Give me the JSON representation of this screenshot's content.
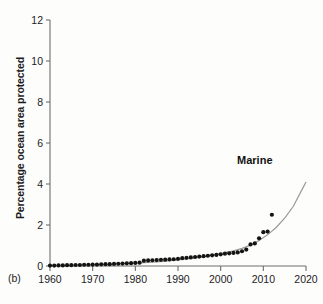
{
  "figure": {
    "panel_tag": "(b)",
    "background_color": "#fdfdfc",
    "axis_color": "#6e6e6e",
    "marker_color": "#141414",
    "curve_color": "#9a9a9a"
  },
  "chart_data": {
    "type": "scatter",
    "title": "",
    "xlabel": "",
    "ylabel": "Percentage ocean area protected",
    "xlim": [
      1960,
      2020
    ],
    "ylim": [
      0,
      12
    ],
    "xticks": [
      1960,
      1970,
      1980,
      1990,
      2000,
      2010,
      2020
    ],
    "xtick_labels": [
      "1960",
      "1970",
      "1980",
      "1990",
      "2000",
      "2010",
      "2020"
    ],
    "yticks": [
      0,
      2,
      4,
      6,
      8,
      10,
      12
    ],
    "ytick_labels": [
      "0",
      "2",
      "4",
      "6",
      "8",
      "10",
      "12"
    ],
    "grid": false,
    "legend_position": "inline-right",
    "annotations": [
      {
        "text": "Marine",
        "x": 2008,
        "y": 5.0
      }
    ],
    "series": [
      {
        "name": "Marine",
        "label": "Marine",
        "type": "scatter",
        "marker": "circle",
        "x": [
          1960,
          1961,
          1962,
          1963,
          1964,
          1965,
          1966,
          1967,
          1968,
          1969,
          1970,
          1971,
          1972,
          1973,
          1974,
          1975,
          1976,
          1977,
          1978,
          1979,
          1980,
          1981,
          1982,
          1983,
          1984,
          1985,
          1986,
          1987,
          1988,
          1989,
          1990,
          1991,
          1992,
          1993,
          1994,
          1995,
          1996,
          1997,
          1998,
          1999,
          2000,
          2001,
          2002,
          2003,
          2004,
          2005,
          2006,
          2007,
          2008,
          2009,
          2010,
          2011,
          2012
        ],
        "values": [
          0.02,
          0.02,
          0.03,
          0.03,
          0.04,
          0.04,
          0.05,
          0.05,
          0.06,
          0.06,
          0.07,
          0.07,
          0.08,
          0.09,
          0.09,
          0.1,
          0.11,
          0.12,
          0.13,
          0.14,
          0.15,
          0.16,
          0.26,
          0.27,
          0.28,
          0.29,
          0.3,
          0.31,
          0.32,
          0.33,
          0.35,
          0.38,
          0.4,
          0.42,
          0.44,
          0.46,
          0.48,
          0.5,
          0.52,
          0.54,
          0.57,
          0.6,
          0.62,
          0.64,
          0.66,
          0.72,
          0.8,
          1.05,
          1.1,
          1.35,
          1.65,
          1.68,
          2.5
        ]
      },
      {
        "name": "Marine fitted trend",
        "label": "Marine",
        "type": "line",
        "x": [
          1960,
          1970,
          1980,
          1985,
          1990,
          1995,
          2000,
          2003,
          2005,
          2007,
          2009,
          2011,
          2013,
          2015,
          2017,
          2019,
          2020
        ],
        "values": [
          0.02,
          0.06,
          0.14,
          0.2,
          0.3,
          0.42,
          0.6,
          0.74,
          0.86,
          1.02,
          1.24,
          1.52,
          1.88,
          2.34,
          2.9,
          3.7,
          4.1
        ]
      }
    ]
  }
}
